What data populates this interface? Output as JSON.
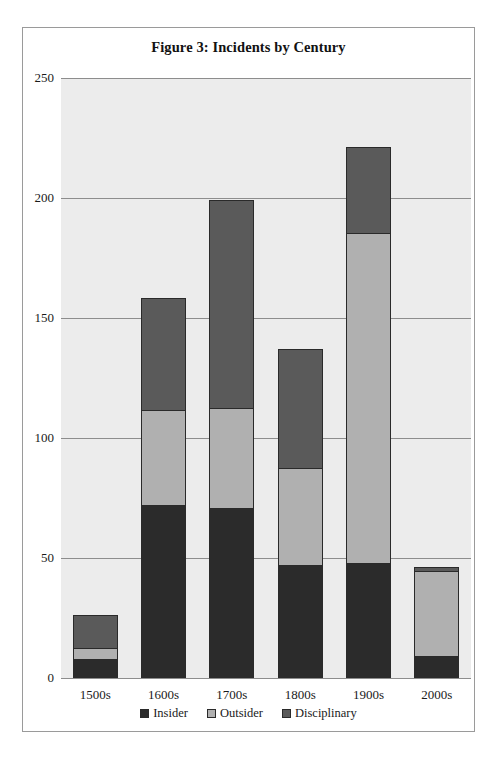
{
  "figure": {
    "title": "Figure 3: Incidents by Century"
  },
  "chart_data": {
    "type": "bar",
    "subtype": "stacked-vertical",
    "title": "Figure 3: Incidents by Century",
    "xlabel": "",
    "ylabel": "",
    "categories": [
      "1500s",
      "1600s",
      "1700s",
      "1800s",
      "1900s",
      "2000s"
    ],
    "series": [
      {
        "name": "Insider",
        "color": "#2b2b2b",
        "values": [
          8,
          72,
          71,
          47,
          48,
          9
        ]
      },
      {
        "name": "Outsider",
        "color": "#b0b0b0",
        "values": [
          5,
          40,
          42,
          41,
          138,
          36
        ]
      },
      {
        "name": "Disciplinary",
        "color": "#5a5a5a",
        "values": [
          14,
          47,
          87,
          50,
          36,
          2
        ]
      }
    ],
    "totals": [
      27,
      159,
      200,
      138,
      222,
      47
    ],
    "ylim": [
      0,
      250
    ],
    "yticks": [
      0,
      50,
      100,
      150,
      200,
      250
    ],
    "ytick_labels": [
      "0",
      "50",
      "100",
      "150",
      "200",
      "250"
    ],
    "grid": true,
    "legend_position": "bottom",
    "plot_background": "#ececec",
    "gridline_color": "#8d8d8d",
    "bar_outline_color": "#2a2a2a"
  }
}
